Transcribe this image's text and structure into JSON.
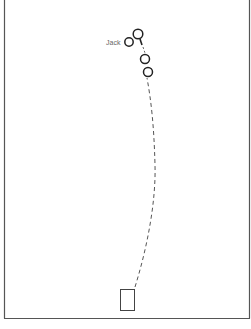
{
  "diagram": {
    "labels": {
      "jack": "Jack"
    },
    "colors": {
      "border": "#555555",
      "stroke": "#222222",
      "path": "#555555",
      "label": "#666666"
    },
    "elements": {
      "balls": [
        {
          "id": "ball-1",
          "cx": 138,
          "cy": 34,
          "r": 4.8
        },
        {
          "id": "jack",
          "cx": 129,
          "cy": 42,
          "r": 4.2
        },
        {
          "id": "ball-2",
          "cx": 145,
          "cy": 59,
          "r": 4.5
        },
        {
          "id": "ball-3",
          "cx": 148,
          "cy": 72,
          "r": 4.5
        }
      ],
      "mat": {
        "x": 120,
        "y": 289,
        "width": 14,
        "height": 21
      }
    }
  }
}
